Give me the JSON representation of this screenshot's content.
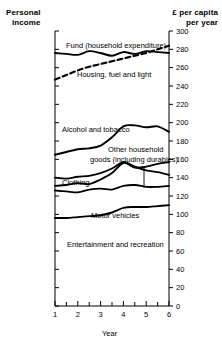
{
  "titles": {
    "left_line1": "Personal",
    "left_line2": "income",
    "right_line1": "£ per capita",
    "right_line2": "per year"
  },
  "axes": {
    "x_label": "Year",
    "x_ticks": [
      "1",
      "2",
      "3",
      "4",
      "5",
      "6"
    ],
    "x_minor_per_interval": 1,
    "y_ticks": [
      "300",
      "280",
      "260",
      "240",
      "220",
      "200",
      "180",
      "160",
      "140",
      "120",
      "100",
      "80",
      "60",
      "40",
      "20",
      "0"
    ],
    "y_axis_side": "right",
    "grid": false
  },
  "labels": {
    "fund": "Fund (household expenditure)",
    "housing": "Housing, fuel and light",
    "alcohol": "Alcohol and tobacco",
    "other_goods_line1": "Other household",
    "other_goods_line2": "goods (including durables)",
    "clothing": "Clothing",
    "motor": "Motor vehicles",
    "entertainment": "Entertainment and recreation"
  },
  "colors": {
    "ink": "#000000",
    "background": "#ffffff"
  },
  "chart_data": {
    "type": "line",
    "title": "Personal income",
    "xlabel": "Year",
    "ylabel": "£ per capita per year",
    "xlim": [
      1,
      6
    ],
    "ylim": [
      0,
      300
    ],
    "grid": false,
    "legend": "inline-annotations",
    "x": [
      1,
      1.5,
      2,
      2.5,
      3,
      3.5,
      4,
      4.5,
      5,
      5.5,
      6
    ],
    "series": [
      {
        "name": "Fund (household expenditure)",
        "style": "solid",
        "values": [
          276,
          275,
          274,
          278,
          276,
          273,
          277,
          275,
          278,
          277,
          276
        ]
      },
      {
        "name": "Housing, fuel and light",
        "style": "dashed",
        "values": [
          247,
          252,
          257,
          261,
          264,
          267,
          270,
          273,
          276,
          280,
          284
        ]
      },
      {
        "name": "Alcohol and tobacco",
        "style": "solid",
        "values": [
          165,
          168,
          171,
          172,
          175,
          184,
          196,
          197,
          195,
          196,
          190
        ]
      },
      {
        "name": "Other household goods (including durables)",
        "style": "solid",
        "values": [
          131,
          132,
          134,
          133,
          138,
          145,
          156,
          151,
          152,
          155,
          157
        ]
      },
      {
        "name": "Clothing",
        "style": "solid",
        "values": [
          140,
          139,
          141,
          142,
          145,
          150,
          157,
          152,
          148,
          146,
          143
        ]
      },
      {
        "name": "Motor vehicles",
        "style": "solid",
        "values": [
          126,
          125,
          124,
          127,
          128,
          127,
          131,
          132,
          130,
          130,
          131
        ]
      },
      {
        "name": "Entertainment and recreation",
        "style": "solid",
        "values": [
          96,
          96,
          97,
          98,
          99,
          102,
          107,
          108,
          108,
          109,
          110
        ]
      }
    ]
  }
}
